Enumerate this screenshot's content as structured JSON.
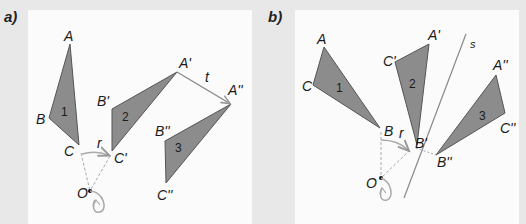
{
  "figure": {
    "panel_a": {
      "label": "a)",
      "triangles": [
        {
          "number": "1",
          "vertices": {
            "A": "A",
            "B": "B",
            "C": "C"
          }
        },
        {
          "number": "2",
          "vertices": {
            "A": "A'",
            "B": "B'",
            "C": "C'"
          }
        },
        {
          "number": "3",
          "vertices": {
            "A": "A''",
            "B": "B''",
            "C": "C''"
          }
        }
      ],
      "rotation_label": "r",
      "translation_label": "t",
      "center_label": "O"
    },
    "panel_b": {
      "label": "b)",
      "triangles": [
        {
          "number": "1",
          "vertices": {
            "A": "A",
            "B": "B",
            "C": "C"
          }
        },
        {
          "number": "2",
          "vertices": {
            "A": "A'",
            "B": "B'",
            "C": "C'"
          }
        },
        {
          "number": "3",
          "vertices": {
            "A": "A''",
            "B": "B''",
            "C": "C''"
          }
        }
      ],
      "rotation_label": "r",
      "axis_label": "s",
      "center_label": "O"
    },
    "colors": {
      "background": "#e8e8e8",
      "panel": "#fbfbfb",
      "triangle_fill": "#8c8c8c",
      "triangle_stroke": "#555555",
      "guide": "#aaaaaa"
    }
  }
}
